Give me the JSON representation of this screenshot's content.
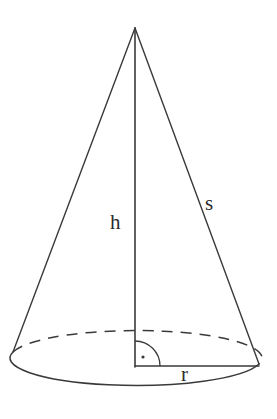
{
  "figure": {
    "name": "right-circular-cone-diagram",
    "background_color": "#ffffff",
    "stroke_color": "#3a3a3a",
    "labels": {
      "height": "h",
      "slant": "s",
      "radius": "r"
    },
    "markers": {
      "right_angle": "right-angle-square-dot"
    }
  },
  "geometry": {
    "apex": {
      "x": 135,
      "y": 28
    },
    "base_center": {
      "x": 136,
      "y": 366
    },
    "base_rx": 124,
    "base_ry": 27,
    "left_tangent": {
      "x": 13,
      "y": 352
    },
    "right_tangent": {
      "x": 259,
      "y": 364
    },
    "right_angle_radius": 25,
    "right_angle_dot": {
      "x": 142,
      "y": 357
    }
  }
}
